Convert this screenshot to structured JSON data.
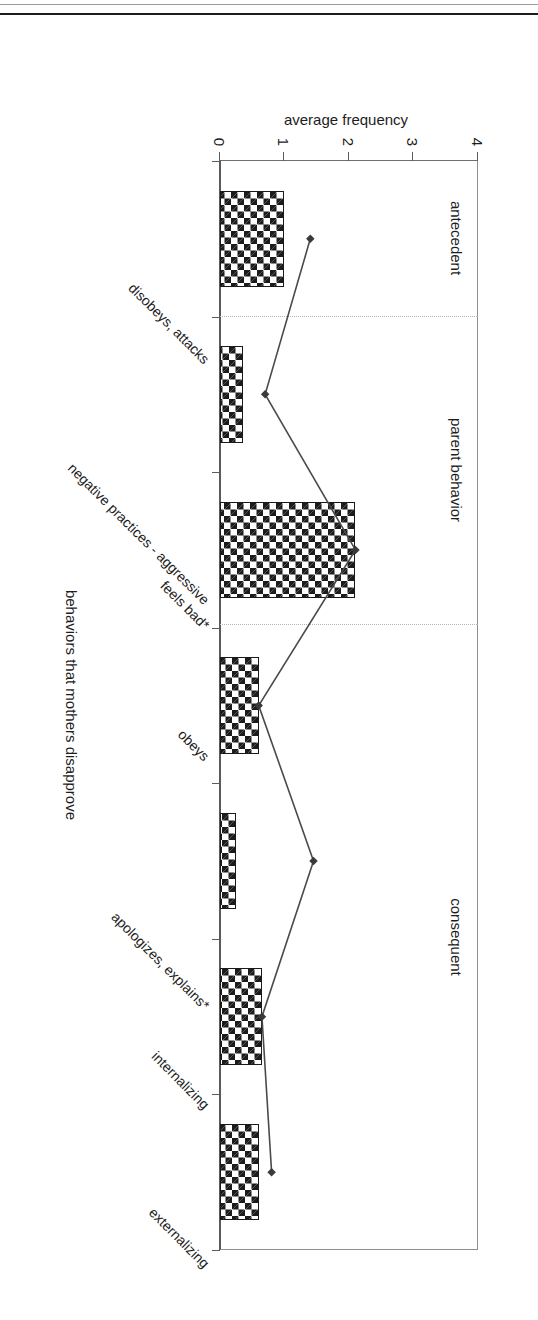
{
  "figure": {
    "value_axis_title": "average frequency",
    "category_axis_title": "behaviors that mothers disapprove",
    "panels": [
      {
        "name": "antecedent",
        "label": "antecedent"
      },
      {
        "name": "parent-behavior",
        "label": "parent behavior"
      },
      {
        "name": "consequent",
        "label": "consequent"
      }
    ],
    "value_ticks": [
      "0",
      "1",
      "2",
      "3",
      "4"
    ],
    "category_labels": [
      "disobeys, attacks",
      "negative practices - aggressive",
      "feels bad*",
      "obeys",
      "apologizes, explains*",
      "internalizing",
      "externalizing"
    ],
    "colors": {
      "bar_fill": "#1c1c1c",
      "bar_background": "#ffffff",
      "bar_outline": "#1a1a1a",
      "line_stroke": "#4a4a4a",
      "marker_fill": "#3a3a3a",
      "axis": "#5a5a5a",
      "grid": "#d8d8d8",
      "panel_separator": "#b4b4b4",
      "text": "#1d1d1d"
    }
  },
  "chart_data": {
    "type": "bar",
    "title": "",
    "subtitle": "",
    "xlabel": "behaviors that mothers disapprove",
    "ylabel": "average frequency",
    "ylim": [
      0,
      4
    ],
    "yticks": [
      0,
      1,
      2,
      3,
      4
    ],
    "grid": false,
    "legend": "none",
    "orientation": "rotated-90",
    "categories": [
      "disobeys, attacks",
      "negative practices - aggressive",
      "feels bad*",
      "obeys",
      "apologizes, explains*",
      "internalizing",
      "externalizing"
    ],
    "panel_groups": [
      {
        "label": "antecedent",
        "categories": [
          "disobeys, attacks"
        ]
      },
      {
        "label": "parent behavior",
        "categories": [
          "negative practices - aggressive",
          "feels bad*"
        ]
      },
      {
        "label": "consequent",
        "categories": [
          "obeys",
          "apologizes, explains*",
          "internalizing",
          "externalizing"
        ]
      }
    ],
    "series": [
      {
        "name": "bars",
        "render": "bar",
        "values": [
          1.0,
          0.35,
          2.1,
          0.6,
          0.25,
          0.65,
          0.6
        ]
      },
      {
        "name": "line",
        "render": "line-with-markers",
        "values": [
          1.4,
          0.7,
          2.1,
          0.6,
          1.45,
          0.65,
          0.8
        ]
      }
    ],
    "annotations": [
      "* marks categories flagged in the original figure"
    ]
  }
}
